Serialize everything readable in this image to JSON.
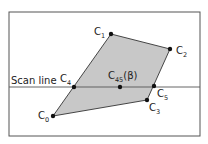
{
  "diagram": {
    "frame": {
      "x": 9,
      "y": 12,
      "w": 191,
      "h": 124,
      "stroke": "#555555"
    },
    "polygon": {
      "fill": "#c8c8c8",
      "stroke": "#333333",
      "order": [
        "C0",
        "C1",
        "C2",
        "C3"
      ]
    },
    "scan_line": {
      "label": "Scan line",
      "y": 87,
      "stroke": "#555555"
    },
    "points": {
      "C0": {
        "x": 53,
        "y": 116,
        "base": "C",
        "sub": "0"
      },
      "C1": {
        "x": 111,
        "y": 34,
        "base": "C",
        "sub": "1"
      },
      "C2": {
        "x": 170,
        "y": 49,
        "base": "C",
        "sub": "2"
      },
      "C3": {
        "x": 147,
        "y": 100,
        "base": "C",
        "sub": "3"
      },
      "C4": {
        "x": 74,
        "y": 87,
        "base": "C",
        "sub": "4"
      },
      "C45": {
        "x": 120,
        "y": 87,
        "base": "C",
        "sub": "45",
        "suffix": "(β)"
      },
      "C5": {
        "x": 154,
        "y": 86,
        "base": "C",
        "sub": "5"
      }
    },
    "point_color": "#111111"
  }
}
